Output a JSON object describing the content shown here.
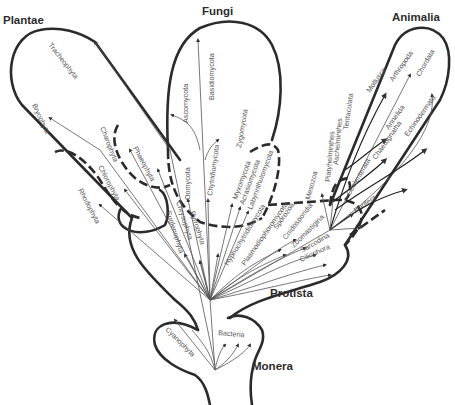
{
  "kingdoms": {
    "plantae": "Plantae",
    "fungi": "Fungi",
    "animalia": "Animalia",
    "protista": "Protista",
    "monera": "Monera"
  },
  "plantae_taxa": [
    "Tracheophyta",
    "Bryophyta",
    "Charophyta",
    "Phaeophyta",
    "Chlorophyta",
    "Rhodophyta"
  ],
  "fungi_taxa": [
    "Basidiomycota",
    "Ascomycota",
    "Zygomycota",
    "Oomycota",
    "Chytridiomycota",
    "Myxomycota",
    "Acrasiomycota",
    "Labyrinthulomycota"
  ],
  "animalia_taxa": [
    "Mollusca",
    "Arthropoda",
    "Chordata",
    "Tentaculata",
    "Annelida",
    "Echinodermata",
    "Platyhelminthes",
    "Aschelminthes",
    "Chaetognatha",
    "Coelenterata",
    "Porifera",
    "Mesozoa"
  ],
  "protista_taxa": [
    "Euglenophyta",
    "Chrysophyta",
    "Pyrrophyta",
    "Hyphochytridiomycota",
    "Plasmodiophoromycota",
    "Sporozoa",
    "Cnidosporidia",
    "Zoomastigina",
    "Sarcodina",
    "Ciliophora"
  ],
  "monera_taxa": [
    "Cyanophyta",
    "Bacteria"
  ],
  "colors": {
    "line": "#2b2b2b",
    "text": "#555555",
    "background": "#ffffff"
  }
}
